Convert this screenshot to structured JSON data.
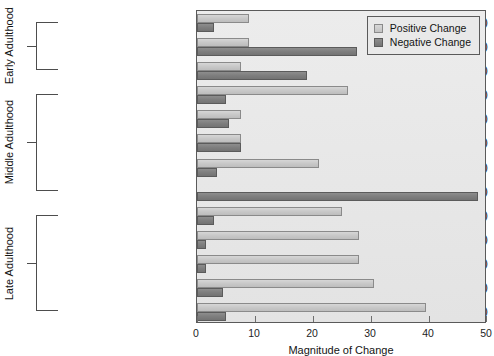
{
  "chart_data": {
    "type": "bar",
    "orientation": "horizontal",
    "title": "",
    "xlabel": "Magnitude of Change",
    "ylabel": "",
    "xlim": [
      0,
      50
    ],
    "xticks": [
      0,
      10,
      20,
      30,
      40,
      50
    ],
    "xtick_labels": [
      "0",
      "10",
      "20",
      "30",
      "40",
      "50"
    ],
    "grid": false,
    "legend_position": "top-right",
    "legend": [
      "Positive Change",
      "Negative Change"
    ],
    "categories": [
      "First job (9)",
      "Marriage (36)",
      "Birth of children (21)",
      "Empty nest (32)",
      "Marriage of children (10)",
      "Birth of grandchildren (12)",
      "Death of first parent (24)",
      "Death of second parent (54)",
      "Retirement (29)",
      "Illness of sibling (28)",
      "Death of a sibling (31)",
      "Illness of spouse (35)",
      "Death of spouse (46)"
    ],
    "series": [
      {
        "name": "Positive Change",
        "color": "#c8c8c8",
        "values": [
          9.0,
          9.0,
          7.5,
          26.0,
          7.5,
          7.5,
          21.0,
          0.0,
          25.0,
          28.0,
          28.0,
          30.5,
          39.5
        ]
      },
      {
        "name": "Negative Change",
        "color": "#7e7e7e",
        "values": [
          3.0,
          27.5,
          19.0,
          5.0,
          5.5,
          7.5,
          3.5,
          48.5,
          3.0,
          1.5,
          1.5,
          4.5,
          5.0
        ]
      }
    ],
    "groups": [
      {
        "label": "Early Adulthood",
        "first_index": 0,
        "last_index": 2
      },
      {
        "label": "Middle Adulthood",
        "first_index": 3,
        "last_index": 7
      },
      {
        "label": "Late Adulthood",
        "first_index": 8,
        "last_index": 12
      }
    ]
  }
}
